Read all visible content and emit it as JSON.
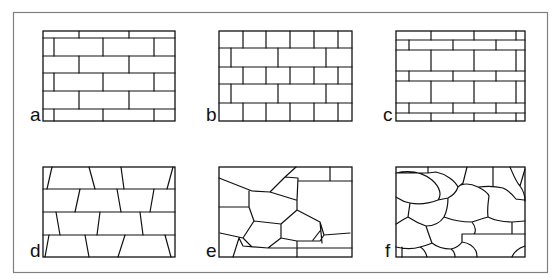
{
  "figure": {
    "frame_color": "#808080",
    "line_color": "#111111",
    "panels": [
      {
        "id": "a",
        "label": "a",
        "pattern": "running bond, regular rectangular bricks with thin top/bottom courses"
      },
      {
        "id": "b",
        "label": "b",
        "pattern": "alternating courses of short and long rectangular blocks"
      },
      {
        "id": "c",
        "label": "c",
        "pattern": "alternating thin courses and tall courses of rectangular blocks"
      },
      {
        "id": "d",
        "label": "d",
        "pattern": "coursed trapezoidal stones with slanted joints"
      },
      {
        "id": "e",
        "label": "e",
        "pattern": "irregular polygonal stones"
      },
      {
        "id": "f",
        "label": "f",
        "pattern": "rounded rubble stones"
      }
    ]
  }
}
